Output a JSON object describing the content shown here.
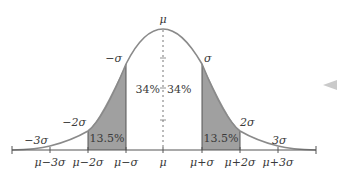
{
  "diagram": {
    "colors": {
      "curve": "#8a8a8a",
      "shade": "#a0a0a0",
      "axis": "#555555",
      "text": "#3a3a3a",
      "mean_line": "#777777"
    },
    "peak_label": "μ",
    "curve_labels": [
      {
        "id": "neg1",
        "text": "−σ"
      },
      {
        "id": "pos1",
        "text": "σ"
      },
      {
        "id": "neg2",
        "text": "−2σ"
      },
      {
        "id": "pos2",
        "text": "2σ"
      },
      {
        "id": "neg3",
        "text": "−3σ"
      },
      {
        "id": "pos3",
        "text": "3σ"
      }
    ],
    "regions": [
      {
        "id": "left_center",
        "text": "34%"
      },
      {
        "id": "right_center",
        "text": "34%"
      },
      {
        "id": "left_shaded",
        "text": "13.5%"
      },
      {
        "id": "right_shaded",
        "text": "13.5%"
      }
    ],
    "axis_ticks": [
      {
        "text": "μ−3σ"
      },
      {
        "text": "μ−2σ"
      },
      {
        "text": "μ−σ"
      },
      {
        "text": "μ"
      },
      {
        "text": "μ+σ"
      },
      {
        "text": "μ+2σ"
      },
      {
        "text": "μ+3σ"
      }
    ]
  }
}
